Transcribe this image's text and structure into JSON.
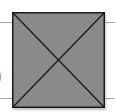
{
  "figure": {
    "type": "image-placeholder",
    "fill_color": "#8a8a8a",
    "stroke_color": "#1a1a1a",
    "rule_color": "#a8a8a8",
    "partial_glyph": ")"
  }
}
